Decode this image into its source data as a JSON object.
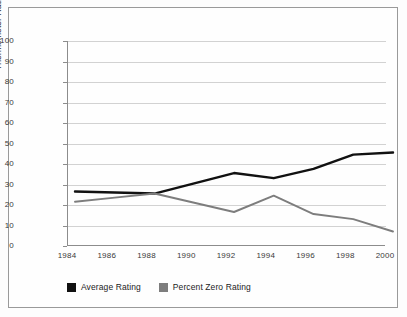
{
  "chart_data": {
    "type": "line",
    "title": "",
    "xlabel": "",
    "ylabel": "Thermometer Rating/Percent",
    "x": [
      1984,
      1986,
      1988,
      1990,
      1992,
      1994,
      1996,
      1998,
      2000
    ],
    "categories": [
      "1984",
      "1986",
      "1988",
      "1990",
      "1992",
      "1994",
      "1996",
      "1998",
      "2000"
    ],
    "xlim": [
      1984,
      2000
    ],
    "ylim": [
      0,
      100
    ],
    "ytick_labels": [
      "100",
      "90",
      "80",
      "70",
      "60",
      "50",
      "40",
      "30",
      "20",
      "10",
      "0"
    ],
    "ytick_values": [
      100,
      90,
      80,
      70,
      60,
      50,
      40,
      30,
      20,
      10,
      0
    ],
    "grid": true,
    "legend_position": "bottom-left",
    "series": [
      {
        "name": "Average Rating",
        "color": "#111111",
        "values": [
          30,
          29.5,
          29,
          34,
          39,
          36.5,
          41,
          48,
          49
        ]
      },
      {
        "name": "Percent Zero Rating",
        "color": "#7d7d7d",
        "values": [
          25,
          27,
          29,
          24.5,
          20,
          28,
          19,
          16.5,
          10.5
        ]
      }
    ]
  },
  "legend": {
    "items": [
      {
        "label": "Average Rating",
        "color": "#111111"
      },
      {
        "label": "Percent Zero Rating",
        "color": "#7d7d7d"
      }
    ]
  },
  "colors": {
    "average_rating": "#111111",
    "percent_zero_rating": "#7d7d7d",
    "gridline": "#d2d2d2",
    "axis": "#8c8c8c",
    "frame_border": "#9a9a9a",
    "background": "#fefefe"
  }
}
